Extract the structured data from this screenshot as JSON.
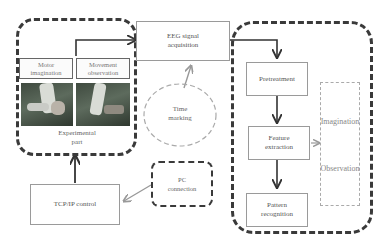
{
  "diagram": {
    "experimental_group": {
      "label_line1": "Experimental",
      "label_line2": "part",
      "tasks": [
        {
          "line1": "Motor",
          "line2": "imagination"
        },
        {
          "line1": "Movement",
          "line2": "observation"
        }
      ]
    },
    "eeg": {
      "line1": "EEG signal",
      "line2": "acquisition"
    },
    "time_marking": {
      "line1": "Time",
      "line2": "marking"
    },
    "processing": {
      "steps": [
        {
          "line1": "Pretreatment",
          "line2": ""
        },
        {
          "line1": "Feature",
          "line2": "extraction"
        },
        {
          "line1": "Pattern",
          "line2": "recognition"
        }
      ]
    },
    "classes": {
      "items": [
        "Imagination",
        "Observation"
      ]
    },
    "tcp": {
      "label": "TCP/IP control"
    },
    "pc": {
      "line1": "PC",
      "line2": "connection"
    },
    "colors": {
      "dark_line": "#333333",
      "light_line": "#9a9a9a",
      "text": "#666666"
    }
  }
}
